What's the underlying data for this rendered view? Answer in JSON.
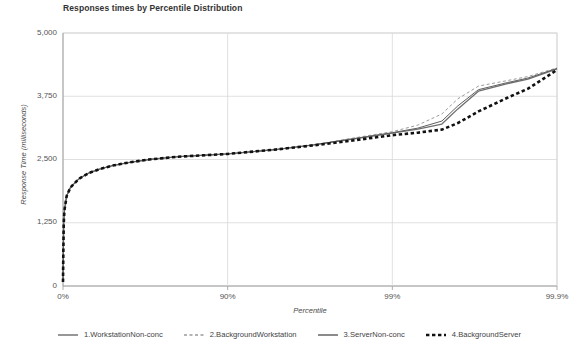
{
  "chart_data": {
    "type": "line",
    "title": "Responses times by Percentile Distribution",
    "xlabel": "Percentile",
    "ylabel": "Response Time (milliseconds)",
    "grid": true,
    "legend_position": "bottom",
    "xscale": "percentile-log",
    "ylim": [
      0,
      5000
    ],
    "yticks": [
      0,
      1250,
      2500,
      3750,
      5000
    ],
    "ytick_labels": [
      "0",
      "1,250",
      "2,500",
      "3,750",
      "5,000"
    ],
    "xticks": [
      0,
      90,
      99,
      99.9
    ],
    "xtick_labels": [
      "0%",
      "90%",
      "99%",
      "99.9%"
    ],
    "x": [
      0,
      0.5,
      1,
      2,
      5,
      10,
      20,
      30,
      40,
      50,
      60,
      70,
      80,
      90,
      95,
      97,
      98,
      99,
      99.3,
      99.5,
      99.6,
      99.7,
      99.8,
      99.85,
      99.9
    ],
    "series": [
      {
        "name": "1.WorkstationNon-conc",
        "color": "#5f5f5f",
        "style": "solid",
        "width": 1,
        "values": [
          80,
          700,
          1230,
          1500,
          1780,
          1950,
          2120,
          2230,
          2310,
          2380,
          2440,
          2500,
          2555,
          2610,
          2700,
          2790,
          2880,
          3030,
          3120,
          3260,
          3560,
          3880,
          4020,
          4110,
          4300
        ]
      },
      {
        "name": "2.BackgroundWorkstation",
        "color": "#9a9a9a",
        "style": "dashed",
        "width": 1,
        "values": [
          80,
          700,
          1230,
          1500,
          1780,
          1950,
          2120,
          2230,
          2310,
          2380,
          2440,
          2500,
          2555,
          2610,
          2700,
          2790,
          2890,
          3050,
          3180,
          3400,
          3700,
          3950,
          4060,
          4140,
          4310
        ]
      },
      {
        "name": "3.ServerNon-conc",
        "color": "#6e6e6e",
        "style": "solid",
        "width": 1.3,
        "values": [
          80,
          700,
          1230,
          1500,
          1780,
          1950,
          2120,
          2230,
          2310,
          2380,
          2440,
          2500,
          2555,
          2610,
          2700,
          2790,
          2875,
          3020,
          3100,
          3200,
          3500,
          3850,
          4000,
          4090,
          4290
        ]
      },
      {
        "name": "4.BackgroundServer",
        "color": "#111111",
        "style": "dashed-thick",
        "width": 2.6,
        "values": [
          80,
          700,
          1230,
          1500,
          1780,
          1950,
          2120,
          2230,
          2310,
          2380,
          2440,
          2500,
          2555,
          2610,
          2700,
          2780,
          2850,
          2980,
          3030,
          3090,
          3220,
          3450,
          3720,
          3900,
          4270
        ]
      }
    ]
  },
  "legend": {
    "items": [
      {
        "label": "1.WorkstationNon-conc"
      },
      {
        "label": "2.BackgroundWorkstation"
      },
      {
        "label": "3.ServerNon-conc"
      },
      {
        "label": "4.BackgroundServer"
      }
    ]
  }
}
